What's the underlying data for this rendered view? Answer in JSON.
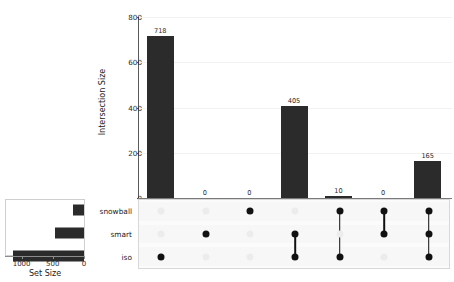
{
  "chart_data": {
    "type": "bar",
    "title": "",
    "subtitle": "",
    "plot_kind": "upset",
    "intersection": {
      "ylabel": "Intersection Size",
      "xlabel": "",
      "ylim": [
        0,
        800
      ],
      "yticks": [
        0,
        200,
        400,
        600,
        800
      ],
      "ytick_labels": [
        "0",
        "200",
        "400",
        "600",
        "800"
      ],
      "grid": true,
      "categories": [
        "iso",
        "smart",
        "snowball",
        "smart-iso",
        "snowball-iso",
        "snowball-smart",
        "snowball-smart-iso"
      ],
      "values": [
        718,
        0,
        0,
        405,
        10,
        0,
        165
      ],
      "value_labels": [
        "718",
        "0",
        "0",
        "405",
        "10",
        "0",
        "165"
      ],
      "bar_color": "#2b2b2b"
    },
    "set_size": {
      "xlabel": "Set Size",
      "axis_reversed": true,
      "xlim": [
        0,
        1250
      ],
      "xticks": [
        1000,
        500,
        0
      ],
      "xtick_labels": [
        "1000",
        "500",
        "0"
      ],
      "sets": [
        "snowball",
        "smart",
        "iso"
      ],
      "values": [
        175,
        470,
        1140
      ],
      "bar_color": "#2b2b2b"
    },
    "matrix": {
      "rows": [
        "snowball",
        "smart",
        "iso"
      ],
      "columns": [
        {
          "name": "iso",
          "members": [
            "iso"
          ]
        },
        {
          "name": "smart",
          "members": [
            "smart"
          ]
        },
        {
          "name": "snowball",
          "members": [
            "snowball"
          ]
        },
        {
          "name": "smart-iso",
          "members": [
            "smart",
            "iso"
          ]
        },
        {
          "name": "snowball-iso",
          "members": [
            "snowball",
            "iso"
          ]
        },
        {
          "name": "snowball-smart",
          "members": [
            "snowball",
            "smart"
          ]
        },
        {
          "name": "snowball-smart-iso",
          "members": [
            "snowball",
            "smart",
            "iso"
          ]
        }
      ],
      "dot_on_color": "#111111",
      "dot_off_color": "#ececec"
    },
    "legend": {
      "entries": [],
      "position": "none"
    }
  },
  "labels": {
    "y_axis_title": "Intersection Size",
    "set_size_title": "Set Size",
    "set_names": [
      "snowball",
      "smart",
      "iso"
    ],
    "y_ticks": [
      "800",
      "600",
      "400",
      "200",
      "0"
    ],
    "set_size_ticks": [
      "1000",
      "500",
      "0"
    ],
    "bar_values": [
      "718",
      "0",
      "0",
      "405",
      "10",
      "0",
      "165"
    ]
  },
  "colors": {
    "bar": "#2b2b2b",
    "dot_on": "#111111",
    "dot_off": "#ececec",
    "grid": "#f2f2f2",
    "axis": "#5a5a5a",
    "matrix_bg": "#fbfbfb",
    "page_bg": "#ffffff"
  }
}
